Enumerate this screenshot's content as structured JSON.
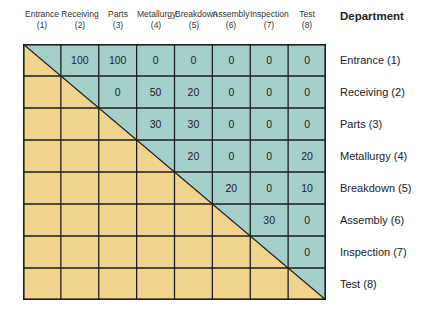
{
  "title": "Department",
  "colors": {
    "upper": "#a5cfc9",
    "lower": "#f0d38d",
    "grid": "#1e1e1e"
  },
  "departments": [
    {
      "name": "Entrance",
      "num": "(1)",
      "label": "Entrance (1)"
    },
    {
      "name": "Receiving",
      "num": "(2)",
      "label": "Receiving (2)"
    },
    {
      "name": "Parts",
      "num": "(3)",
      "label": "Parts (3)"
    },
    {
      "name": "Metallurgy",
      "num": "(4)",
      "label": "Metallurgy (4)"
    },
    {
      "name": "Breakdown",
      "num": "(5)",
      "label": "Breakdown (5)"
    },
    {
      "name": "Assembly",
      "num": "(6)",
      "label": "Assembly (6)"
    },
    {
      "name": "Inspection",
      "num": "(7)",
      "label": "Inspection (7)"
    },
    {
      "name": "Test",
      "num": "(8)",
      "label": "Test (8)"
    }
  ],
  "matrix": [
    [
      "",
      "100",
      "100",
      "0",
      "0",
      "0",
      "0",
      "0"
    ],
    [
      "",
      "",
      "0",
      "50",
      "20",
      "0",
      "0",
      "0"
    ],
    [
      "",
      "",
      "",
      "30",
      "30",
      "0",
      "0",
      "0"
    ],
    [
      "",
      "",
      "",
      "",
      "20",
      "0",
      "0",
      "20"
    ],
    [
      "",
      "",
      "",
      "",
      "",
      "20",
      "0",
      "10"
    ],
    [
      "",
      "",
      "",
      "",
      "",
      "",
      "30",
      "0"
    ],
    [
      "",
      "",
      "",
      "",
      "",
      "",
      "",
      "0"
    ],
    [
      "",
      "",
      "",
      "",
      "",
      "",
      "",
      ""
    ]
  ]
}
